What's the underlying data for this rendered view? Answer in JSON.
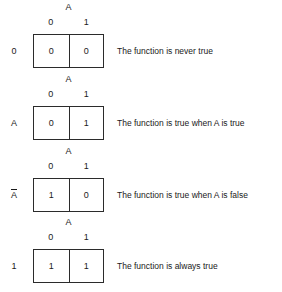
{
  "figure": {
    "type": "karnaugh-map-series",
    "variable_label": "A",
    "column_headers": [
      "0",
      "1"
    ],
    "rows": [
      {
        "row_label": "0",
        "row_label_overlined": false,
        "cells": [
          "0",
          "0"
        ],
        "description": "The function is never true"
      },
      {
        "row_label": "A",
        "row_label_overlined": false,
        "cells": [
          "0",
          "1"
        ],
        "description": "The function is true when A is true"
      },
      {
        "row_label": "A",
        "row_label_overlined": true,
        "cells": [
          "1",
          "0"
        ],
        "description": "The function is true when A is false"
      },
      {
        "row_label": "1",
        "row_label_overlined": false,
        "cells": [
          "1",
          "1"
        ],
        "description": "The function is always true"
      }
    ]
  },
  "colors": {
    "background": "#ffffff",
    "border": "#2b2b2b",
    "text": "#1a1a1a"
  }
}
